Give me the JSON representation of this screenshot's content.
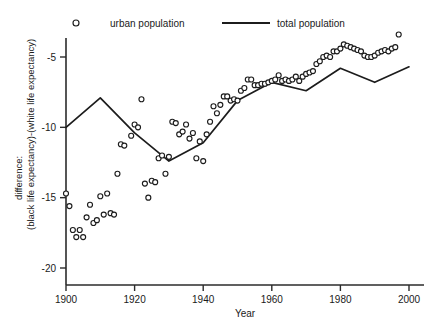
{
  "figure": {
    "background": "#ffffff",
    "ink_color": "#1c1c1c"
  },
  "legend": {
    "position": "top",
    "entries": [
      {
        "label": "urban population",
        "marker": "open-circle",
        "color": "#1c1c1c"
      },
      {
        "label": "total population",
        "marker": "line",
        "color": "#1c1c1c"
      }
    ]
  },
  "axes": {
    "x": {
      "title": "Year",
      "ticks": [
        1900,
        1920,
        1940,
        1960,
        1980,
        2000
      ],
      "tick_labels": [
        "1900",
        "1920",
        "1940",
        "1960",
        "1980",
        "2000"
      ],
      "range": [
        1898,
        2002
      ]
    },
    "y": {
      "title_line1": "difference:",
      "title_line2": "(black life expectancy)-(white life expectancy)",
      "ticks": [
        -5,
        -10,
        -15,
        -20
      ],
      "tick_labels": [
        "-5",
        "-10",
        "-15",
        "-20"
      ],
      "range": [
        -20.6,
        -3.0
      ]
    }
  },
  "chart_data": {
    "type": "scatter",
    "title": "",
    "xlabel": "Year",
    "ylabel": "difference: (black life expectancy)-(white life expectancy)",
    "xlim": [
      1898,
      2002
    ],
    "ylim": [
      -20.6,
      -3.0
    ],
    "grid": false,
    "legend_position": "top",
    "series": [
      {
        "name": "urban population",
        "type": "scatter",
        "marker": "open-circle",
        "color": "#1c1c1c",
        "points": [
          [
            1900,
            -14.7
          ],
          [
            1901,
            -15.6
          ],
          [
            1902,
            -17.3
          ],
          [
            1903,
            -17.8
          ],
          [
            1904,
            -17.3
          ],
          [
            1905,
            -17.8
          ],
          [
            1906,
            -16.4
          ],
          [
            1907,
            -15.5
          ],
          [
            1908,
            -16.8
          ],
          [
            1909,
            -16.6
          ],
          [
            1910,
            -14.9
          ],
          [
            1911,
            -16.2
          ],
          [
            1912,
            -14.7
          ],
          [
            1913,
            -16.1
          ],
          [
            1914,
            -16.2
          ],
          [
            1915,
            -13.3
          ],
          [
            1916,
            -11.2
          ],
          [
            1917,
            -11.3
          ],
          [
            1919,
            -10.6
          ],
          [
            1920,
            -9.8
          ],
          [
            1921,
            -10.0
          ],
          [
            1922,
            -8.0
          ],
          [
            1923,
            -14.0
          ],
          [
            1924,
            -15.0
          ],
          [
            1925,
            -13.8
          ],
          [
            1926,
            -13.9
          ],
          [
            1927,
            -12.2
          ],
          [
            1928,
            -12.0
          ],
          [
            1929,
            -13.3
          ],
          [
            1930,
            -12.1
          ],
          [
            1931,
            -9.6
          ],
          [
            1932,
            -9.7
          ],
          [
            1933,
            -10.5
          ],
          [
            1934,
            -10.3
          ],
          [
            1935,
            -9.8
          ],
          [
            1936,
            -10.8
          ],
          [
            1937,
            -10.4
          ],
          [
            1938,
            -12.2
          ],
          [
            1939,
            -11.0
          ],
          [
            1940,
            -12.4
          ],
          [
            1941,
            -10.5
          ],
          [
            1942,
            -9.6
          ],
          [
            1943,
            -8.5
          ],
          [
            1944,
            -9.0
          ],
          [
            1945,
            -8.4
          ],
          [
            1946,
            -7.8
          ],
          [
            1947,
            -7.8
          ],
          [
            1948,
            -8.1
          ],
          [
            1949,
            -8.0
          ],
          [
            1950,
            -8.1
          ],
          [
            1951,
            -7.4
          ],
          [
            1952,
            -7.2
          ],
          [
            1953,
            -6.6
          ],
          [
            1954,
            -6.6
          ],
          [
            1955,
            -7.0
          ],
          [
            1956,
            -7.0
          ],
          [
            1957,
            -6.9
          ],
          [
            1958,
            -6.9
          ],
          [
            1959,
            -6.8
          ],
          [
            1960,
            -6.7
          ],
          [
            1961,
            -6.6
          ],
          [
            1962,
            -6.3
          ],
          [
            1963,
            -6.7
          ],
          [
            1964,
            -6.6
          ],
          [
            1965,
            -6.7
          ],
          [
            1966,
            -6.6
          ],
          [
            1967,
            -6.4
          ],
          [
            1968,
            -6.7
          ],
          [
            1969,
            -6.4
          ],
          [
            1970,
            -6.2
          ],
          [
            1971,
            -6.1
          ],
          [
            1972,
            -6.0
          ],
          [
            1973,
            -5.5
          ],
          [
            1974,
            -5.3
          ],
          [
            1975,
            -5.0
          ],
          [
            1976,
            -4.9
          ],
          [
            1977,
            -5.0
          ],
          [
            1978,
            -4.6
          ],
          [
            1979,
            -4.6
          ],
          [
            1980,
            -4.4
          ],
          [
            1981,
            -4.1
          ],
          [
            1982,
            -4.2
          ],
          [
            1983,
            -4.3
          ],
          [
            1984,
            -4.4
          ],
          [
            1985,
            -4.5
          ],
          [
            1986,
            -4.6
          ],
          [
            1987,
            -4.9
          ],
          [
            1988,
            -5.0
          ],
          [
            1989,
            -5.0
          ],
          [
            1990,
            -4.9
          ],
          [
            1991,
            -4.7
          ],
          [
            1992,
            -4.6
          ],
          [
            1993,
            -4.5
          ],
          [
            1994,
            -4.6
          ],
          [
            1995,
            -4.4
          ],
          [
            1996,
            -4.3
          ],
          [
            1997,
            -3.4
          ]
        ]
      },
      {
        "name": "total population",
        "type": "line",
        "color": "#1c1c1c",
        "points": [
          [
            1900,
            -10.0
          ],
          [
            1910,
            -7.9
          ],
          [
            1920,
            -10.4
          ],
          [
            1930,
            -12.4
          ],
          [
            1940,
            -11.1
          ],
          [
            1950,
            -8.1
          ],
          [
            1960,
            -6.8
          ],
          [
            1970,
            -7.4
          ],
          [
            1980,
            -5.8
          ],
          [
            1990,
            -6.8
          ],
          [
            2000,
            -5.7
          ]
        ]
      }
    ]
  }
}
